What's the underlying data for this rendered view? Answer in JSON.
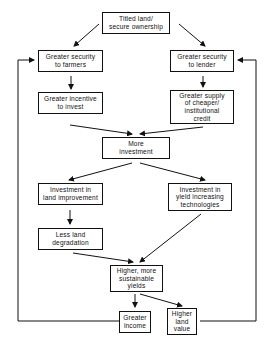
{
  "diagram": {
    "type": "flowchart",
    "nodes": {
      "titled_land": "Titled land/\nsecure ownership",
      "security_farmers": "Greater security\nto farmers",
      "security_lender": "Greater security\nto lender",
      "incentive_invest": "Greater incentive\nto invest",
      "supply_credit": "Greater supply\nof cheaper/\ninstitutional\ncredit",
      "more_investment": "More\ninvestment",
      "land_improvement": "Investment in\nland improvement",
      "yield_tech": "Investment in\nyield increasing\ntechnologies",
      "less_degradation": "Less land\ndegradation",
      "higher_yields": "Higher, more\nsustainable\nyields",
      "greater_income": "Greater\nincome",
      "land_value": "Higher\nland\nvalue"
    },
    "edges": [
      {
        "from": "titled_land",
        "to": "security_farmers"
      },
      {
        "from": "titled_land",
        "to": "security_lender"
      },
      {
        "from": "security_farmers",
        "to": "incentive_invest"
      },
      {
        "from": "security_lender",
        "to": "supply_credit"
      },
      {
        "from": "incentive_invest",
        "to": "more_investment"
      },
      {
        "from": "supply_credit",
        "to": "more_investment"
      },
      {
        "from": "more_investment",
        "to": "land_improvement"
      },
      {
        "from": "more_investment",
        "to": "yield_tech"
      },
      {
        "from": "land_improvement",
        "to": "less_degradation"
      },
      {
        "from": "less_degradation",
        "to": "higher_yields"
      },
      {
        "from": "yield_tech",
        "to": "higher_yields"
      },
      {
        "from": "higher_yields",
        "to": "greater_income"
      },
      {
        "from": "higher_yields",
        "to": "land_value"
      },
      {
        "from": "greater_income",
        "to": "security_farmers",
        "kind": "feedback-loop"
      },
      {
        "from": "land_value",
        "to": "security_lender",
        "kind": "feedback-loop"
      }
    ],
    "colors": {
      "line": "#111111",
      "background": "#ffffff"
    }
  }
}
